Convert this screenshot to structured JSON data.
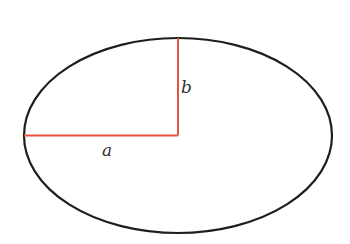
{
  "diagram": {
    "type": "ellipse-axes",
    "ellipse": {
      "cx": 178,
      "cy": 135.5,
      "rx": 154,
      "ry": 97.5,
      "stroke": "#1e1e1e"
    },
    "semi_major": {
      "label": "a",
      "color": "#e8553f"
    },
    "semi_minor": {
      "label": "b",
      "color": "#e8553f"
    }
  }
}
